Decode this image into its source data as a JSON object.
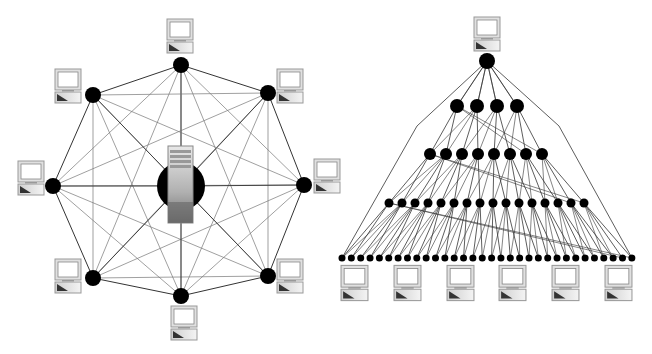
{
  "diagrams": [
    {
      "name": "mesh-network",
      "type": "fully-connected mesh with central server",
      "peripheral_nodes": 8,
      "center": "server"
    },
    {
      "name": "hierarchical-tree-network",
      "type": "layered tree",
      "levels": [
        1,
        4,
        8,
        16,
        32
      ],
      "workstations_bottom": 6
    }
  ],
  "colors": {
    "node": "#000000",
    "edge": "#333333",
    "edge_light": "#777777",
    "computer_frame": "#d8d8d8",
    "background": "#ffffff"
  }
}
